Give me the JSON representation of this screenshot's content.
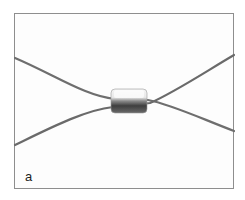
{
  "figure": {
    "label": "a",
    "colors": {
      "frame": "#8e8e8e",
      "background": "#fdfdfd",
      "wire": "#6e6e6e",
      "sleeve_light": "#eeeeee",
      "sleeve_dark": "#4a4a4a"
    }
  }
}
